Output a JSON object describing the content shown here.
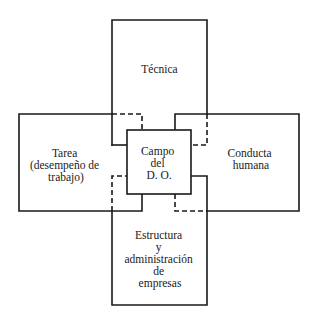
{
  "diagram": {
    "type": "overlapping-boxes",
    "center": {
      "label_lines": [
        "Campo",
        "del",
        "D. O."
      ]
    },
    "boxes": {
      "top": {
        "label_lines": [
          "Técnica"
        ]
      },
      "left": {
        "label_lines": [
          "Tarea",
          "(desempeño de",
          "trabajo)"
        ]
      },
      "right": {
        "label_lines": [
          "Conducta",
          "humana"
        ]
      },
      "bottom": {
        "label_lines": [
          "Estructura",
          "y",
          "administración",
          "de",
          "empresas"
        ]
      }
    },
    "colors": {
      "line": "#1a1a1a",
      "background": "#ffffff"
    }
  }
}
